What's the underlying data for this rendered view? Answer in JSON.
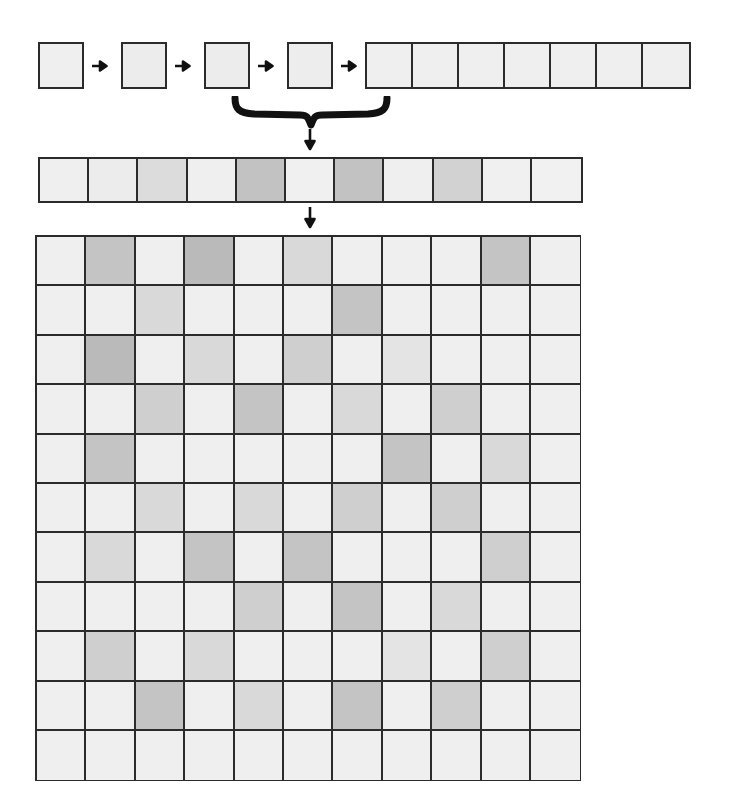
{
  "diagram": {
    "colors": {
      "outline": "#2b2b2b",
      "background": "#ffffff",
      "shade_0": "#efefef",
      "shade_1": "#e6e6e6",
      "shade_2": "#dcdcdc",
      "shade_3": "#cfcfcf",
      "shade_4": "#c2c2c2",
      "shade_5": "#b8b8b8"
    }
  },
  "sequence_row": {
    "label": "top-sequence-of-tiles",
    "squares": [
      {
        "name": "square-1",
        "shade": "#efefef",
        "x": 38
      },
      {
        "name": "square-2",
        "shade": "#ececec",
        "x": 121
      },
      {
        "name": "square-3",
        "shade": "#ececec",
        "x": 204
      },
      {
        "name": "square-4",
        "shade": "#ededed",
        "x": 287
      }
    ],
    "arrows": [
      {
        "name": "arrow-1",
        "x": 92
      },
      {
        "name": "arrow-2",
        "x": 175
      },
      {
        "name": "arrow-3",
        "x": 258
      },
      {
        "name": "arrow-4",
        "x": 341
      }
    ],
    "strip7": {
      "name": "tile-run-of-seven",
      "x": 365,
      "count": 7,
      "shades": [
        "#efefef",
        "#efefef",
        "#efefef",
        "#efefef",
        "#efefef",
        "#efefef",
        "#efefef"
      ]
    }
  },
  "brace": {
    "name": "grouping-brace",
    "left": 237,
    "right": 383,
    "tip_x": 310,
    "direction": "down"
  },
  "arrows_vertical": [
    {
      "name": "arrow-brace-to-strip",
      "x": 303,
      "y": 129
    },
    {
      "name": "arrow-strip-to-grid",
      "x": 303,
      "y": 207
    }
  ],
  "strip": {
    "name": "flattened-sequence-strip",
    "count": 11,
    "shades": [
      "#efefef",
      "#ececec",
      "#dcdcdc",
      "#efefef",
      "#c2c2c2",
      "#f0f0f0",
      "#c2c2c2",
      "#efefef",
      "#d2d2d2",
      "#f0f0f0",
      "#f1f1f1"
    ]
  },
  "chart_data": {
    "type": "heatmap",
    "title": "",
    "rows": 11,
    "cols": 11,
    "xlabel": "",
    "ylabel": "",
    "legend": [],
    "grid": true,
    "palette": {
      "0": "#efefef",
      "1": "#e4e4e4",
      "2": "#d9d9d9",
      "3": "#cfcfcf",
      "4": "#c4c4c4",
      "5": "#bababa"
    },
    "values": [
      [
        0,
        4,
        0,
        5,
        0,
        2,
        0,
        0,
        0,
        4,
        0
      ],
      [
        0,
        0,
        2,
        0,
        0,
        0,
        4,
        0,
        0,
        0,
        0
      ],
      [
        0,
        5,
        0,
        2,
        0,
        3,
        0,
        1,
        0,
        0,
        0
      ],
      [
        0,
        0,
        3,
        0,
        4,
        0,
        2,
        0,
        3,
        0,
        0
      ],
      [
        0,
        4,
        0,
        0,
        0,
        0,
        0,
        4,
        0,
        2,
        0
      ],
      [
        0,
        0,
        2,
        0,
        2,
        0,
        3,
        0,
        3,
        0,
        0
      ],
      [
        0,
        2,
        0,
        4,
        0,
        4,
        0,
        0,
        0,
        3,
        0
      ],
      [
        0,
        0,
        0,
        0,
        3,
        0,
        4,
        0,
        2,
        0,
        0
      ],
      [
        0,
        3,
        0,
        2,
        0,
        0,
        0,
        1,
        0,
        3,
        0
      ],
      [
        0,
        0,
        4,
        0,
        2,
        0,
        4,
        0,
        3,
        0,
        0
      ],
      [
        0,
        0,
        0,
        0,
        0,
        0,
        0,
        0,
        0,
        0,
        0
      ]
    ]
  }
}
